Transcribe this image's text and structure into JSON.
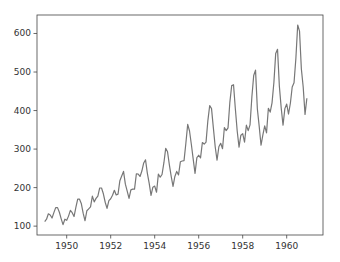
{
  "chart_data": {
    "type": "line",
    "title": "",
    "xlabel": "",
    "ylabel": "",
    "xlim": [
      1948.65,
      1961.65
    ],
    "ylim": [
      77,
      648
    ],
    "grid": false,
    "legend": null,
    "x_ticks": [
      1950,
      1952,
      1954,
      1956,
      1958,
      1960
    ],
    "x_tick_labels": [
      "1950",
      "1952",
      "1954",
      "1956",
      "1958",
      "1960"
    ],
    "y_ticks": [
      100,
      200,
      300,
      400,
      500,
      600
    ],
    "y_tick_labels": [
      "100",
      "200",
      "300",
      "400",
      "500",
      "600"
    ],
    "line_color": "#777777",
    "series": [
      {
        "name": "passengers",
        "x_start": 1949.0,
        "x_step": 0.083333,
        "values": [
          112,
          118,
          132,
          129,
          121,
          135,
          148,
          148,
          136,
          119,
          104,
          118,
          115,
          126,
          141,
          135,
          125,
          149,
          170,
          170,
          158,
          133,
          114,
          140,
          145,
          150,
          178,
          163,
          172,
          178,
          199,
          199,
          184,
          162,
          146,
          166,
          171,
          180,
          193,
          181,
          183,
          218,
          230,
          242,
          209,
          191,
          172,
          194,
          196,
          196,
          236,
          235,
          229,
          243,
          264,
          272,
          237,
          211,
          180,
          201,
          204,
          188,
          235,
          227,
          234,
          264,
          302,
          293,
          259,
          229,
          203,
          229,
          242,
          233,
          267,
          269,
          270,
          315,
          364,
          347,
          312,
          274,
          237,
          278,
          284,
          277,
          317,
          313,
          318,
          374,
          413,
          405,
          355,
          306,
          271,
          306,
          315,
          301,
          356,
          348,
          355,
          422,
          465,
          467,
          404,
          347,
          305,
          336,
          340,
          318,
          362,
          348,
          363,
          435,
          491,
          505,
          404,
          359,
          310,
          337,
          360,
          342,
          406,
          396,
          420,
          472,
          548,
          559,
          463,
          407,
          362,
          405,
          417,
          391,
          419,
          461,
          472,
          535,
          622,
          606,
          508,
          461,
          390,
          432
        ]
      }
    ]
  }
}
